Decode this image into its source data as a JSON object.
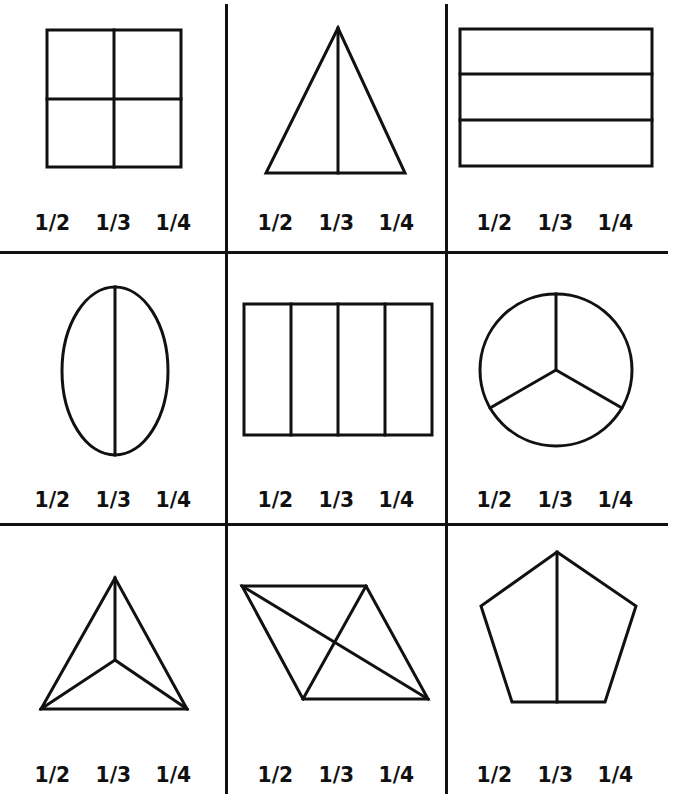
{
  "worksheet": {
    "title": "Fractions of shapes - circle the fraction shown",
    "columns": 3,
    "rows": 3,
    "ink_color": "#111111",
    "background_color": "#ffffff",
    "cells": [
      {
        "shape": "square",
        "divided_into": 4,
        "description": "square split into 4 equal quarters",
        "options": [
          "1/2",
          "1/3",
          "1/4"
        ]
      },
      {
        "shape": "triangle",
        "divided_into": 2,
        "description": "isosceles triangle split in half by a vertical line",
        "options": [
          "1/2",
          "1/3",
          "1/4"
        ]
      },
      {
        "shape": "rectangle",
        "divided_into": 3,
        "description": "rectangle split into 3 horizontal strips",
        "options": [
          "1/2",
          "1/3",
          "1/4"
        ]
      },
      {
        "shape": "oval",
        "divided_into": 2,
        "description": "oval split in half by a vertical line",
        "options": [
          "1/2",
          "1/3",
          "1/4"
        ]
      },
      {
        "shape": "rectangle",
        "divided_into": 4,
        "description": "rectangle split into 4 vertical strips",
        "options": [
          "1/2",
          "1/3",
          "1/4"
        ]
      },
      {
        "shape": "circle",
        "divided_into": 3,
        "description": "circle split into 3 equal sectors",
        "options": [
          "1/2",
          "1/3",
          "1/4"
        ]
      },
      {
        "shape": "triangle",
        "divided_into": 3,
        "description": "triangle split into 3 parts from its center",
        "options": [
          "1/2",
          "1/3",
          "1/4"
        ]
      },
      {
        "shape": "parallelogram",
        "divided_into": 4,
        "description": "parallelogram split into 4 parts by its diagonals",
        "options": [
          "1/2",
          "1/3",
          "1/4"
        ]
      },
      {
        "shape": "pentagon",
        "divided_into": 2,
        "description": "pentagon split in half by a vertical line",
        "options": [
          "1/2",
          "1/3",
          "1/4"
        ]
      }
    ]
  }
}
